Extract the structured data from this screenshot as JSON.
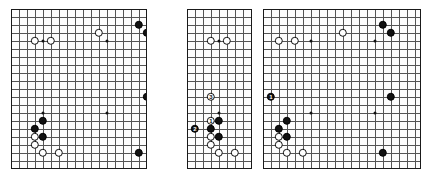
{
  "figure": {
    "type": "go-board-diagrams",
    "panel_count": 3,
    "grid_spacing_px": 8,
    "stone_diameter_px": 8.4,
    "colors": {
      "black_stone": "#111111",
      "white_stone": "#ffffff",
      "stone_outline": "#111111",
      "grid_line": "#555555",
      "board_border": "#1a1a1a",
      "board_background": "#fdfdfd",
      "page_background": "#ffffff",
      "number_on_black": "#ffffff",
      "number_on_white": "#111111"
    }
  },
  "boards": [
    {
      "name": "diagram-1",
      "label": "",
      "x": 11,
      "y": 9,
      "w": 136,
      "h": 160,
      "cols": 17,
      "rows": 20,
      "star_points": [
        [
          4,
          4
        ],
        [
          12,
          4
        ],
        [
          4,
          13
        ],
        [
          12,
          13
        ]
      ],
      "stones": [
        {
          "color": "white",
          "col": 3,
          "row": 4,
          "label": ""
        },
        {
          "color": "white",
          "col": 5,
          "row": 4,
          "label": ""
        },
        {
          "color": "white",
          "col": 11,
          "row": 3,
          "label": ""
        },
        {
          "color": "black",
          "col": 16,
          "row": 2,
          "label": ""
        },
        {
          "color": "black",
          "col": 17,
          "row": 3,
          "label": ""
        },
        {
          "color": "black",
          "col": 17,
          "row": 11,
          "label": ""
        },
        {
          "color": "black",
          "col": 16,
          "row": 18,
          "label": ""
        },
        {
          "color": "black",
          "col": 4,
          "row": 14,
          "label": ""
        },
        {
          "color": "black",
          "col": 3,
          "row": 15,
          "label": ""
        },
        {
          "color": "black",
          "col": 4,
          "row": 16,
          "label": ""
        },
        {
          "color": "white",
          "col": 3,
          "row": 16,
          "label": ""
        },
        {
          "color": "white",
          "col": 3,
          "row": 17,
          "label": ""
        },
        {
          "color": "white",
          "col": 4,
          "row": 18,
          "label": ""
        },
        {
          "color": "white",
          "col": 6,
          "row": 18,
          "label": ""
        }
      ]
    },
    {
      "name": "diagram-2",
      "label": "",
      "x": 187,
      "y": 9,
      "w": 65,
      "h": 160,
      "cols": 8,
      "rows": 20,
      "star_points": [
        [
          4,
          4
        ],
        [
          4,
          13
        ]
      ],
      "stones": [
        {
          "color": "white",
          "col": 3,
          "row": 4,
          "label": ""
        },
        {
          "color": "white",
          "col": 5,
          "row": 4,
          "label": ""
        },
        {
          "color": "white",
          "col": 3,
          "row": 11,
          "label": "3"
        },
        {
          "color": "white",
          "col": 3,
          "row": 14,
          "label": "1"
        },
        {
          "color": "black",
          "col": 1,
          "row": 15,
          "label": "2"
        },
        {
          "color": "black",
          "col": 4,
          "row": 14,
          "label": ""
        },
        {
          "color": "black",
          "col": 3,
          "row": 15,
          "label": ""
        },
        {
          "color": "black",
          "col": 4,
          "row": 16,
          "label": ""
        },
        {
          "color": "white",
          "col": 3,
          "row": 16,
          "label": ""
        },
        {
          "color": "white",
          "col": 3,
          "row": 17,
          "label": ""
        },
        {
          "color": "white",
          "col": 4,
          "row": 18,
          "label": ""
        },
        {
          "color": "white",
          "col": 6,
          "row": 18,
          "label": ""
        }
      ]
    },
    {
      "name": "diagram-3",
      "label": "",
      "x": 263,
      "y": 9,
      "w": 158,
      "h": 160,
      "cols": 19,
      "rows": 20,
      "star_points": [
        [
          6,
          4
        ],
        [
          14,
          4
        ],
        [
          6,
          13
        ],
        [
          14,
          13
        ]
      ],
      "stones": [
        {
          "color": "white",
          "col": 2,
          "row": 4,
          "label": ""
        },
        {
          "color": "white",
          "col": 4,
          "row": 4,
          "label": ""
        },
        {
          "color": "white",
          "col": 10,
          "row": 3,
          "label": ""
        },
        {
          "color": "black",
          "col": 15,
          "row": 2,
          "label": ""
        },
        {
          "color": "black",
          "col": 16,
          "row": 3,
          "label": ""
        },
        {
          "color": "black",
          "col": 16,
          "row": 11,
          "label": ""
        },
        {
          "color": "black",
          "col": 15,
          "row": 18,
          "label": ""
        },
        {
          "color": "black",
          "col": 1,
          "row": 11,
          "label": "1"
        },
        {
          "color": "black",
          "col": 3,
          "row": 14,
          "label": ""
        },
        {
          "color": "black",
          "col": 2,
          "row": 15,
          "label": ""
        },
        {
          "color": "black",
          "col": 3,
          "row": 16,
          "label": ""
        },
        {
          "color": "white",
          "col": 2,
          "row": 16,
          "label": ""
        },
        {
          "color": "white",
          "col": 2,
          "row": 17,
          "label": ""
        },
        {
          "color": "white",
          "col": 3,
          "row": 18,
          "label": ""
        },
        {
          "color": "white",
          "col": 5,
          "row": 18,
          "label": ""
        }
      ]
    }
  ]
}
